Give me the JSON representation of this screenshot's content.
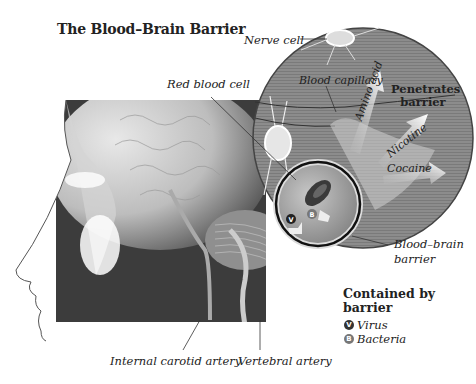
{
  "title": "The Blood–Brain Barrier",
  "labels": {
    "nerve_cell": "Nerve cell",
    "red_blood_cell": "Red blood cell",
    "blood_capillary": "Blood capillary",
    "blood_brain_barrier_line1": "Blood–brain",
    "blood_brain_barrier_line2": "barrier",
    "internal_carotid_artery": "Internal carotid artery",
    "vertebral_artery": "Vertebral artery"
  },
  "penetrates": {
    "heading_line1": "Penetrates",
    "heading_line2": "barrier",
    "arrows": [
      "Amino acid",
      "Nicotine",
      "Cocaine"
    ]
  },
  "contained": {
    "heading_line1": "Contained by",
    "heading_line2": "barrier",
    "items": [
      {
        "badge": "V",
        "label": "Virus"
      },
      {
        "badge": "B",
        "label": "Bacteria"
      }
    ]
  },
  "colors": {
    "circle_fill": "#8a8a8a",
    "dark_bg": "#3a3a3a",
    "inner_circle": "#9a9a9a",
    "ink": "#222222"
  }
}
